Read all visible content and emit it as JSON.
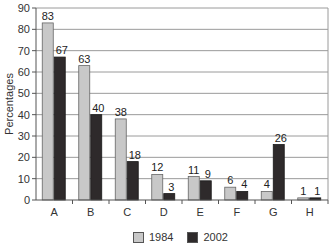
{
  "chart_data": {
    "type": "bar",
    "title": "",
    "xlabel": "",
    "ylabel": "Percentages",
    "ylim": [
      0,
      90
    ],
    "yticks": [
      0,
      10,
      20,
      30,
      40,
      50,
      60,
      70,
      80,
      90
    ],
    "grid": true,
    "legend_position": "bottom",
    "categories": [
      "A",
      "B",
      "C",
      "D",
      "E",
      "F",
      "G",
      "H"
    ],
    "series": [
      {
        "name": "1984",
        "color": "#c8c8c8",
        "values": [
          83,
          63,
          38,
          12,
          11,
          6,
          4,
          1
        ]
      },
      {
        "name": "2002",
        "color": "#2e2a2b",
        "values": [
          67,
          40,
          18,
          3,
          9,
          4,
          26,
          1
        ]
      }
    ]
  },
  "legend": {
    "items": [
      {
        "label": "1984",
        "color": "#c8c8c8"
      },
      {
        "label": "2002",
        "color": "#2e2a2b"
      }
    ]
  }
}
